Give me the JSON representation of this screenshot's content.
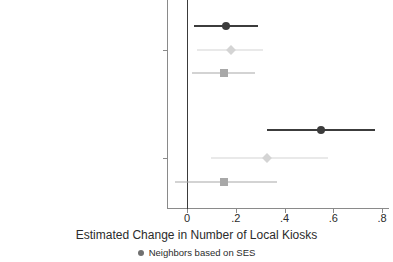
{
  "chart_data": {
    "type": "scatter",
    "title": "",
    "xlabel": "Estimated Change in Number of Local Kiosks",
    "ylabel": "",
    "xlim": [
      -0.09,
      0.82
    ],
    "xticks": [
      0,
      0.2,
      0.4,
      0.6,
      0.8
    ],
    "xtick_labels": [
      "0",
      ".2",
      ".4",
      ".6",
      ".8"
    ],
    "grid": false,
    "reference_line": 0,
    "legend_position": "bottom",
    "legend": [
      {
        "label": "Neighbors based on SES",
        "marker": "circle",
        "color": "#707070"
      }
    ],
    "categories": [
      "SDWA Health Violations (Direct)",
      "SDWA Health Violations (Indirect)"
    ],
    "series": [
      {
        "name": "Neighbors based on SES",
        "marker": "circle",
        "color": "#3c3c3c",
        "estimates": [
          {
            "category": "SDWA Health Violations (Direct)",
            "value": 0.16,
            "ci_low": 0.03,
            "ci_high": 0.29
          },
          {
            "category": "SDWA Health Violations (Indirect)",
            "value": 0.55,
            "ci_low": 0.33,
            "ci_high": 0.77
          }
        ]
      },
      {
        "name": "Series 2",
        "marker": "diamond",
        "color": "#d4d4d4",
        "estimates": [
          {
            "category": "SDWA Health Violations (Direct)",
            "value": 0.18,
            "ci_low": 0.04,
            "ci_high": 0.31
          },
          {
            "category": "SDWA Health Violations (Indirect)",
            "value": 0.33,
            "ci_low": 0.1,
            "ci_high": 0.58
          }
        ]
      },
      {
        "name": "Series 3",
        "marker": "square",
        "color": "#a8a8a8",
        "estimates": [
          {
            "category": "SDWA Health Violations (Direct)",
            "value": 0.15,
            "ci_low": 0.02,
            "ci_high": 0.28
          },
          {
            "category": "SDWA Health Violations (Indirect)",
            "value": 0.15,
            "ci_low": -0.05,
            "ci_high": 0.37
          }
        ]
      }
    ],
    "rows": [
      {
        "id": "row-1",
        "group": "SDWA Health Violations (Direct)",
        "marker": "circle",
        "color": "#3c3c3c",
        "value": 0.16,
        "ci_low": 0.03,
        "ci_high": 0.29,
        "y": 26
      },
      {
        "id": "row-2",
        "group": "SDWA Health Violations (Direct)",
        "marker": "diamond",
        "color": "#d4d4d4",
        "value": 0.18,
        "ci_low": 0.04,
        "ci_high": 0.31,
        "y": 50
      },
      {
        "id": "row-3",
        "group": "SDWA Health Violations (Direct)",
        "marker": "square",
        "color": "#a8a8a8",
        "value": 0.15,
        "ci_low": 0.02,
        "ci_high": 0.28,
        "y": 73
      },
      {
        "id": "row-4",
        "group": "SDWA Health Violations (Indirect)",
        "marker": "circle",
        "color": "#3c3c3c",
        "value": 0.55,
        "ci_low": 0.33,
        "ci_high": 0.77,
        "y": 130
      },
      {
        "id": "row-5",
        "group": "SDWA Health Violations (Indirect)",
        "marker": "diamond",
        "color": "#d4d4d4",
        "value": 0.33,
        "ci_low": 0.1,
        "ci_high": 0.58,
        "y": 158
      },
      {
        "id": "row-6",
        "group": "SDWA Health Violations (Indirect)",
        "marker": "square",
        "color": "#a8a8a8",
        "value": 0.15,
        "ci_low": -0.05,
        "ci_high": 0.37,
        "y": 182
      }
    ],
    "category_tick_y": [
      50,
      158
    ],
    "colors": {
      "dark": "#3c3c3c",
      "mid": "#a8a8a8",
      "light": "#d4d4d4",
      "axis": "#8a8a8a",
      "text": "#2b2b2b"
    }
  }
}
